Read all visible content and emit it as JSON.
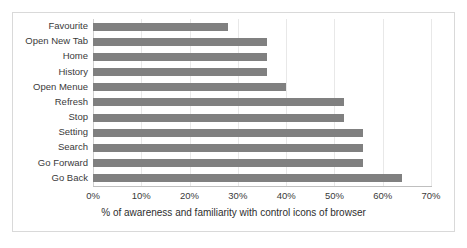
{
  "chart_data": {
    "type": "bar",
    "orientation": "horizontal",
    "title": "",
    "subtitle": "",
    "xlabel": "% of awareness and familiarity with control icons of browser",
    "ylabel": "",
    "categories": [
      "Favourite",
      "Open New Tab",
      "Home",
      "History",
      "Open Menue",
      "Refresh",
      "Stop",
      "Setting",
      "Search",
      "Go Forward",
      "Go Back"
    ],
    "values": [
      28,
      36,
      36,
      36,
      40,
      52,
      52,
      56,
      56,
      56,
      64
    ],
    "xlim": [
      0,
      70
    ],
    "xtick_values": [
      0,
      10,
      20,
      30,
      40,
      50,
      60,
      70
    ],
    "xtick_labels": [
      "0%",
      "10%",
      "20%",
      "30%",
      "40%",
      "50%",
      "60%",
      "70%"
    ],
    "grid": true,
    "grid_axis": "x",
    "legend": false,
    "legend_position": "none",
    "bar_color": "#808080",
    "gridline_color": "#e8e8e8",
    "axis_line_color": "#bfbfbf",
    "plot_background": "#ffffff",
    "border_color": "#d9d9d9",
    "text_color": "#3a3a3a"
  }
}
